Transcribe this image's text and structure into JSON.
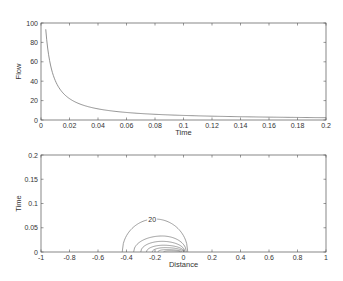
{
  "chart_data": [
    {
      "type": "line",
      "title": "",
      "xlabel": "Time",
      "ylabel": "Flow",
      "xlim": [
        0,
        0.2
      ],
      "ylim": [
        0,
        100
      ],
      "xticks": [
        "0",
        "0.02",
        "0.04",
        "0.06",
        "0.08",
        "0.1",
        "0.12",
        "0.14",
        "0.16",
        "0.18",
        "0.2"
      ],
      "yticks": [
        "0",
        "20",
        "40",
        "60",
        "80",
        "100"
      ],
      "grid": false,
      "series": [
        {
          "name": "Flow",
          "x": [
            0.003,
            0.005,
            0.01,
            0.015,
            0.02,
            0.03,
            0.04,
            0.05,
            0.06,
            0.08,
            0.1,
            0.12,
            0.14,
            0.16,
            0.18,
            0.2
          ],
          "y": [
            100,
            82,
            58,
            45,
            35,
            25,
            19,
            15,
            12,
            8.5,
            6.5,
            5,
            4,
            3.3,
            2.8,
            2.4
          ]
        }
      ]
    },
    {
      "type": "contour",
      "title": "",
      "xlabel": "Distance",
      "ylabel": "Time",
      "xlim": [
        -1,
        1
      ],
      "ylim": [
        0,
        0.2
      ],
      "xticks": [
        "-1",
        "-0.8",
        "-0.6",
        "-0.4",
        "-0.2",
        "0",
        "0.2",
        "0.4",
        "0.6",
        "0.8",
        "1"
      ],
      "yticks": [
        "0",
        "0.05",
        "0.1",
        "0.15",
        "0.2"
      ],
      "grid": false,
      "annotations": [
        {
          "text": "20",
          "x": -0.22,
          "y": 0.066
        }
      ],
      "contour_levels": [
        20,
        40,
        60,
        80,
        100,
        120
      ]
    }
  ]
}
